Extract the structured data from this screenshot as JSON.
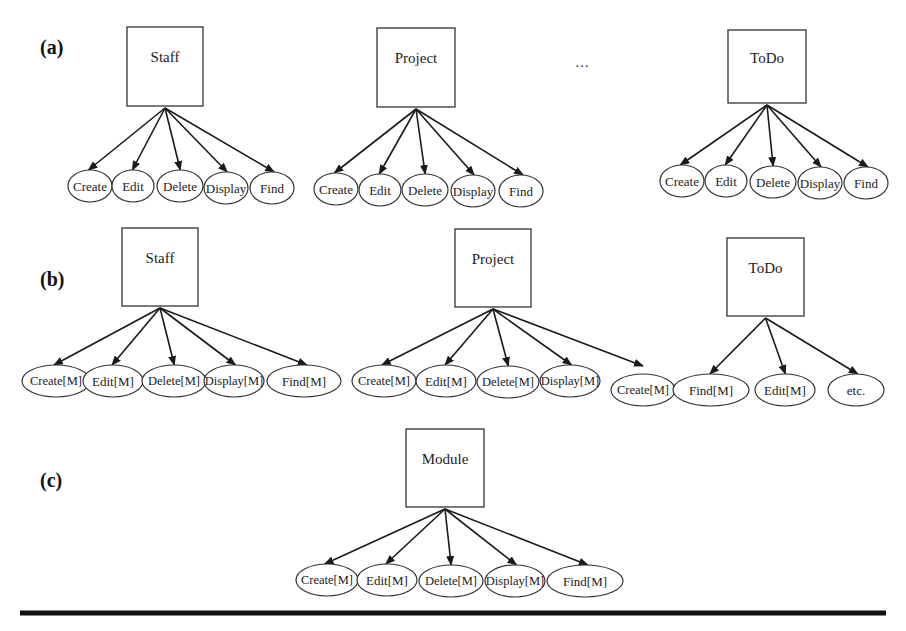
{
  "figure": {
    "panels": [
      {
        "label": "(a)",
        "label_pos": [
          40,
          47
        ],
        "groups": [
          {
            "parent": "Staff",
            "box": [
              127,
              27,
              76,
              79
            ],
            "children": [
              {
                "label": "Create",
                "cx": 90,
                "cy": 186,
                "rx": 22,
                "ry": 16
              },
              {
                "label": "Edit",
                "cx": 133,
                "cy": 186,
                "rx": 21,
                "ry": 16
              },
              {
                "label": "Delete",
                "cx": 180,
                "cy": 186,
                "rx": 23,
                "ry": 16
              },
              {
                "label": "Display",
                "cx": 226,
                "cy": 188,
                "rx": 22,
                "ry": 16
              },
              {
                "label": "Find",
                "cx": 272,
                "cy": 188,
                "rx": 22,
                "ry": 16
              }
            ]
          },
          {
            "parent": "Project",
            "box": [
              377,
              28,
              78,
              79
            ],
            "children": [
              {
                "label": "Create",
                "cx": 336,
                "cy": 189,
                "rx": 22,
                "ry": 16
              },
              {
                "label": "Edit",
                "cx": 380,
                "cy": 190,
                "rx": 21,
                "ry": 16
              },
              {
                "label": "Delete",
                "cx": 425,
                "cy": 190,
                "rx": 23,
                "ry": 16
              },
              {
                "label": "Display",
                "cx": 473,
                "cy": 191,
                "rx": 22,
                "ry": 16
              },
              {
                "label": "Find",
                "cx": 521,
                "cy": 191,
                "rx": 22,
                "ry": 16
              }
            ]
          },
          {
            "parent": "ToDo",
            "box": [
              728,
              30,
              78,
              73
            ],
            "children": [
              {
                "label": "Create",
                "cx": 682,
                "cy": 181,
                "rx": 22,
                "ry": 16
              },
              {
                "label": "Edit",
                "cx": 726,
                "cy": 181,
                "rx": 21,
                "ry": 16
              },
              {
                "label": "Delete",
                "cx": 773,
                "cy": 182,
                "rx": 23,
                "ry": 16
              },
              {
                "label": "Display",
                "cx": 820,
                "cy": 183,
                "rx": 22,
                "ry": 16
              },
              {
                "label": "Find",
                "cx": 866,
                "cy": 183,
                "rx": 22,
                "ry": 16
              }
            ]
          }
        ],
        "ellipsis": {
          "text": "…",
          "pos": [
            582,
            62
          ]
        }
      },
      {
        "label": "(b)",
        "label_pos": [
          40,
          279
        ],
        "groups": [
          {
            "parent": "Staff",
            "box": [
              122,
              228,
              76,
              78
            ],
            "children": [
              {
                "label": "Create[M]",
                "cx": 56,
                "cy": 381,
                "rx": 34,
                "ry": 16
              },
              {
                "label": "Edit[M]",
                "cx": 113,
                "cy": 381,
                "rx": 30,
                "ry": 16
              },
              {
                "label": "Delete[M]",
                "cx": 174,
                "cy": 381,
                "rx": 32,
                "ry": 16
              },
              {
                "label": "Display[M]",
                "cx": 234,
                "cy": 381,
                "rx": 30,
                "ry": 16
              },
              {
                "label": "Find[M]",
                "cx": 304,
                "cy": 381,
                "rx": 37,
                "ry": 16
              }
            ]
          },
          {
            "parent": "Project",
            "box": [
              455,
              229,
              76,
              78
            ],
            "children": [
              {
                "label": "Create[M]",
                "cx": 384,
                "cy": 381,
                "rx": 32,
                "ry": 16
              },
              {
                "label": "Edit[M]",
                "cx": 446,
                "cy": 381,
                "rx": 30,
                "ry": 16
              },
              {
                "label": "Delete[M]",
                "cx": 508,
                "cy": 382,
                "rx": 31,
                "ry": 16
              },
              {
                "label": "Display[M]",
                "cx": 570,
                "cy": 381,
                "rx": 30,
                "ry": 16
              }
            ],
            "extra_arrow_to": [
              643,
              366
            ]
          },
          {
            "parent": "ToDo",
            "box": [
              727,
              238,
              77,
              78
            ],
            "children": [
              {
                "label": "Create[M]",
                "cx": 643,
                "cy": 390,
                "rx": 32,
                "ry": 16
              },
              {
                "label": "Find[M]",
                "cx": 711,
                "cy": 390,
                "rx": 38,
                "ry": 16,
                "linked": true
              },
              {
                "label": "Edit[M]",
                "cx": 785,
                "cy": 390,
                "rx": 30,
                "ry": 16,
                "linked": true
              },
              {
                "label": "etc.",
                "cx": 856,
                "cy": 390,
                "rx": 28,
                "ry": 16,
                "linked": true
              }
            ]
          }
        ]
      },
      {
        "label": "(c)",
        "label_pos": [
          40,
          480
        ],
        "groups": [
          {
            "parent": "Module",
            "box": [
              406,
              429,
              78,
              78
            ],
            "children": [
              {
                "label": "Create[M]",
                "cx": 327,
                "cy": 580,
                "rx": 31,
                "ry": 16
              },
              {
                "label": "Edit[M]",
                "cx": 387,
                "cy": 580,
                "rx": 30,
                "ry": 16
              },
              {
                "label": "Delete[M]",
                "cx": 451,
                "cy": 581,
                "rx": 32,
                "ry": 16
              },
              {
                "label": "Display[M]",
                "cx": 515,
                "cy": 581,
                "rx": 30,
                "ry": 16
              },
              {
                "label": "Find[M]",
                "cx": 585,
                "cy": 581,
                "rx": 38,
                "ry": 16
              }
            ]
          }
        ]
      }
    ],
    "rule": {
      "x1": 20,
      "x2": 886,
      "y": 613,
      "thickness": 5
    }
  },
  "colors": {
    "stroke": "#333333",
    "edge": "#1a1a1a",
    "text": "#222222",
    "background": "#ffffff"
  }
}
